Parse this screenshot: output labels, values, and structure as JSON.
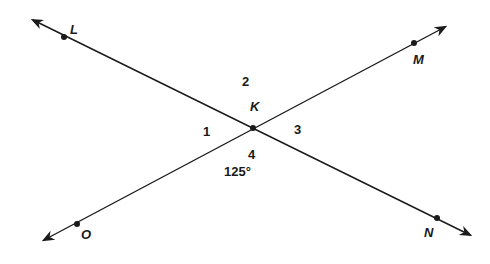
{
  "diagram": {
    "points": [
      {
        "name": "L",
        "x": 64,
        "y": 37
      },
      {
        "name": "M",
        "x": 414,
        "y": 43
      },
      {
        "name": "K",
        "x": 253,
        "y": 128
      },
      {
        "name": "O",
        "x": 77,
        "y": 224
      },
      {
        "name": "N",
        "x": 437,
        "y": 218
      }
    ],
    "lines": [
      {
        "name": "line LN",
        "from": [
          33,
          20
        ],
        "to": [
          470,
          235
        ]
      },
      {
        "name": "line OM",
        "from": [
          44,
          240
        ],
        "to": [
          445,
          27
        ]
      }
    ],
    "labels": {
      "L": "L",
      "M": "M",
      "K": "K",
      "O": "O",
      "N": "N",
      "angle1": "1",
      "angle2": "2",
      "angle3": "3",
      "angle4": "4",
      "angle4_measure": "125°"
    },
    "colors": {
      "stroke": "#1a1a1a",
      "background": "#ffffff"
    }
  }
}
